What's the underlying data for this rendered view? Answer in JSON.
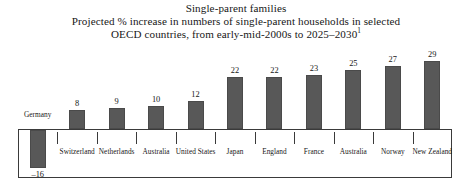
{
  "title": {
    "line1": "Single-parent families",
    "line2": "Projected % increase in numbers of single-parent households in selected",
    "line3": "OECD countries, from early-mid-2000s to 2025–2030",
    "footnote_marker": "1"
  },
  "chart_data": {
    "type": "bar",
    "xlabel": "",
    "ylabel": "",
    "ylim": [
      -16,
      29
    ],
    "grid": false,
    "legend": "none",
    "baseline": 0,
    "value_suffix": "%",
    "categories": [
      "Germany",
      "Switzerland",
      "Netherlands",
      "Australia",
      "United States",
      "Japan",
      "England",
      "France",
      "Australia",
      "Norway",
      "New Zealand"
    ],
    "values": [
      -16,
      8,
      9,
      10,
      12,
      22,
      22,
      23,
      25,
      27,
      29
    ],
    "value_labels": [
      "–16",
      "8",
      "9",
      "10",
      "12",
      "22",
      "22",
      "23",
      "25",
      "27",
      "29"
    ],
    "series": [
      {
        "name": "Projected % increase",
        "values": [
          -16,
          8,
          9,
          10,
          12,
          22,
          22,
          23,
          25,
          27,
          29
        ]
      }
    ]
  },
  "colors": {
    "bar_fill": "#585858",
    "bar_stroke": "#4a4a4a",
    "axis": "#3a3a3a",
    "text": "#171717",
    "background": "#ffffff"
  }
}
